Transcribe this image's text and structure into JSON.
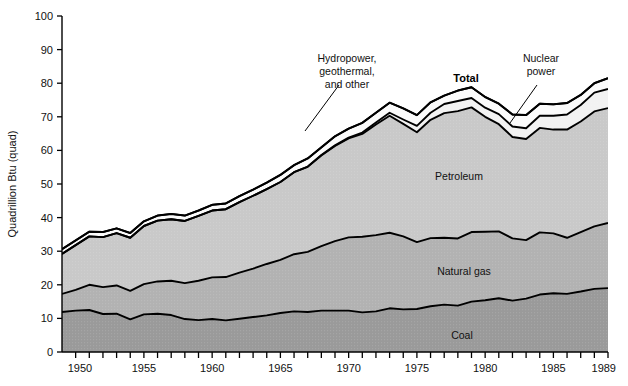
{
  "chart_data": {
    "type": "area",
    "title": "",
    "subtitle": "",
    "xlabel": "",
    "ylabel": "Quadrillion Btu (quad)",
    "xlim": [
      1949,
      1989
    ],
    "ylim": [
      0,
      100
    ],
    "grid": false,
    "legend_position": "inline-annotations",
    "stacked": true,
    "x_tick_interval": 1,
    "x_label_interval": 5,
    "y_tick_interval": 10,
    "x_tick_labels": [
      "1950",
      "1955",
      "1960",
      "1965",
      "1970",
      "1975",
      "1980",
      "1985",
      "1989"
    ],
    "x_tick_label_years": [
      1950,
      1955,
      1960,
      1965,
      1970,
      1975,
      1980,
      1985,
      1989
    ],
    "y_tick_labels": [
      "0",
      "10",
      "20",
      "30",
      "40",
      "50",
      "60",
      "70",
      "80",
      "90",
      "100"
    ],
    "x": [
      1949,
      1950,
      1951,
      1952,
      1953,
      1954,
      1955,
      1956,
      1957,
      1958,
      1959,
      1960,
      1961,
      1962,
      1963,
      1964,
      1965,
      1966,
      1967,
      1968,
      1969,
      1970,
      1971,
      1972,
      1973,
      1974,
      1975,
      1976,
      1977,
      1978,
      1979,
      1980,
      1981,
      1982,
      1983,
      1984,
      1985,
      1986,
      1987,
      1988,
      1989
    ],
    "series": [
      {
        "name": "Coal",
        "color": "#9a9a9a",
        "label_position": {
          "year": 1981,
          "value": 5
        },
        "values": [
          11.9,
          12.3,
          12.5,
          11.3,
          11.4,
          9.7,
          11.2,
          11.4,
          11.0,
          9.8,
          9.5,
          9.8,
          9.4,
          9.9,
          10.4,
          10.9,
          11.6,
          12.1,
          11.9,
          12.3,
          12.3,
          12.3,
          11.8,
          12.1,
          13.0,
          12.7,
          12.8,
          13.6,
          14.1,
          13.8,
          15.0,
          15.4,
          16.0,
          15.3,
          15.9,
          17.1,
          17.5,
          17.3,
          18.0,
          18.8,
          19.0
        ]
      },
      {
        "name": "Natural gas",
        "color": "#b2b2b2",
        "label_position": {
          "year": 1981,
          "value": 25
        },
        "values": [
          5.4,
          6.2,
          7.5,
          8.0,
          8.4,
          8.5,
          9.0,
          9.6,
          10.2,
          10.7,
          11.7,
          12.4,
          12.9,
          13.7,
          14.4,
          15.3,
          15.8,
          17.0,
          17.9,
          19.2,
          20.7,
          21.8,
          22.5,
          22.7,
          22.5,
          21.7,
          19.9,
          20.3,
          19.9,
          20.0,
          20.7,
          20.4,
          19.9,
          18.5,
          17.4,
          18.5,
          17.8,
          16.7,
          17.7,
          18.6,
          19.4
        ]
      },
      {
        "name": "Petroleum",
        "color": "#c9c9c9",
        "label_position": {
          "year": 1973,
          "value": 48
        },
        "values": [
          11.9,
          13.3,
          14.4,
          14.9,
          15.6,
          15.8,
          17.3,
          18.1,
          18.3,
          18.5,
          19.3,
          19.9,
          20.2,
          21.0,
          21.7,
          22.3,
          23.2,
          24.4,
          25.3,
          27.0,
          28.3,
          29.5,
          30.6,
          32.9,
          34.8,
          33.5,
          32.7,
          35.2,
          37.1,
          37.9,
          37.1,
          34.2,
          31.9,
          30.2,
          30.1,
          31.1,
          30.9,
          32.2,
          32.9,
          34.2,
          34.2
        ]
      },
      {
        "name": "Nuclear power",
        "color": "#f2f2f2",
        "label_position": {
          "year": 1981,
          "value": 84
        },
        "values": [
          0.0,
          0.0,
          0.0,
          0.0,
          0.0,
          0.0,
          0.0,
          0.0,
          0.0,
          0.0,
          0.0,
          0.0,
          0.0,
          0.0,
          0.0,
          0.0,
          0.0,
          0.0,
          0.1,
          0.1,
          0.2,
          0.2,
          0.4,
          0.6,
          0.9,
          1.3,
          1.9,
          2.1,
          2.7,
          3.0,
          2.8,
          2.7,
          3.0,
          3.1,
          3.2,
          3.6,
          4.1,
          4.5,
          4.9,
          5.6,
          5.7
        ]
      },
      {
        "name": "Hydropower, geothermal, and other",
        "color": "#fbfbfb",
        "label_position": {
          "year": 1968,
          "value": 90
        },
        "values": [
          1.4,
          1.4,
          1.4,
          1.5,
          1.4,
          1.4,
          1.4,
          1.5,
          1.6,
          1.6,
          1.6,
          1.7,
          1.7,
          1.8,
          1.8,
          1.9,
          2.1,
          2.1,
          2.4,
          2.3,
          2.7,
          2.7,
          2.9,
          2.9,
          3.0,
          3.3,
          3.2,
          3.1,
          2.5,
          3.1,
          3.2,
          3.2,
          3.1,
          3.6,
          3.9,
          3.6,
          3.4,
          3.4,
          3.0,
          2.8,
          3.2
        ]
      }
    ],
    "total": {
      "name": "Total",
      "label_position": {
        "year": 1977,
        "value": 85
      },
      "values": [
        30.6,
        33.2,
        35.8,
        35.7,
        36.8,
        35.4,
        38.9,
        40.6,
        41.1,
        40.6,
        42.1,
        43.8,
        44.2,
        46.4,
        48.3,
        50.4,
        52.7,
        55.6,
        57.6,
        60.9,
        64.2,
        66.5,
        68.2,
        71.2,
        74.2,
        72.5,
        70.5,
        74.3,
        76.3,
        77.8,
        78.8,
        75.9,
        73.9,
        70.7,
        70.5,
        73.9,
        73.7,
        74.1,
        76.5,
        80.0,
        81.5
      ]
    },
    "annotations": [
      {
        "id": "hydro-annotation",
        "text_lines": [
          "Hydropower,",
          "geothermal,",
          "and other"
        ],
        "bold": false,
        "text_anchor": {
          "x": 347,
          "y": 62
        },
        "leader_from": {
          "x": 339,
          "y": 85
        },
        "leader_to": {
          "x": 305,
          "y": 131
        }
      },
      {
        "id": "total-annotation",
        "text_lines": [
          "Total"
        ],
        "bold": true,
        "text_anchor": {
          "x": 466,
          "y": 82
        },
        "leader_from": null,
        "leader_to": null
      },
      {
        "id": "nuclear-annotation",
        "text_lines": [
          "Nuclear",
          "power"
        ],
        "bold": false,
        "text_anchor": {
          "x": 541,
          "y": 62
        },
        "leader_from": {
          "x": 537,
          "y": 85
        },
        "leader_to": {
          "x": 510,
          "y": 123
        }
      }
    ],
    "inline_band_labels": [
      {
        "id": "petroleum-label",
        "text": "Petroleum",
        "x": 459,
        "y": 180
      },
      {
        "id": "natural-gas-label",
        "text": "Natural gas",
        "x": 464,
        "y": 275
      },
      {
        "id": "coal-label",
        "text": "Coal",
        "x": 462,
        "y": 339
      }
    ]
  },
  "colors": {
    "coal": "#9a9a9a",
    "natural_gas": "#b2b2b2",
    "petroleum": "#c9c9c9",
    "nuclear": "#f2f2f2",
    "hydro": "#fbfbfb",
    "axis": "#000000",
    "background": "#ffffff"
  }
}
